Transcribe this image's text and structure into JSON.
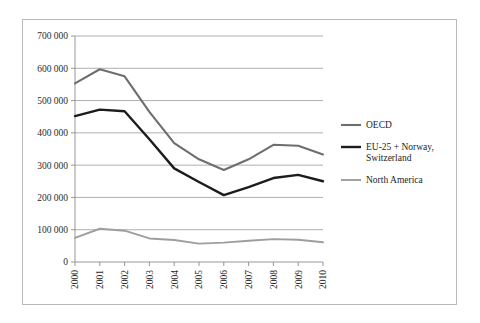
{
  "chart_data": {
    "type": "line",
    "title": "",
    "subtitle": "",
    "xlabel": "",
    "ylabel": "",
    "x": [
      "2000",
      "2001",
      "2002",
      "2003",
      "2004",
      "2005",
      "2006",
      "2007",
      "2008",
      "2009",
      "2010"
    ],
    "categories": [
      "2000",
      "2001",
      "2002",
      "2003",
      "2004",
      "2005",
      "2006",
      "2007",
      "2008",
      "2009",
      "2010"
    ],
    "ylim": [
      0,
      700000
    ],
    "ytick_values": [
      0,
      100000,
      200000,
      300000,
      400000,
      500000,
      600000,
      700000
    ],
    "ytick_labels": [
      "0",
      "100 000",
      "200 000",
      "300 000",
      "400 000",
      "500 000",
      "600 000",
      "700 000"
    ],
    "grid": true,
    "grid_axis": "y",
    "legend_position": "right",
    "xtick_rotation": 90,
    "series": [
      {
        "name": "OECD",
        "color": "#6e6e6e",
        "width": 2.1,
        "values": [
          553000,
          597000,
          575000,
          465000,
          368000,
          318000,
          285000,
          318000,
          363000,
          360000,
          333000
        ]
      },
      {
        "name": "EU-25 + Norway, Switzerland",
        "color": "#1c1c1c",
        "width": 2.4,
        "values": [
          452000,
          472000,
          467000,
          380000,
          290000,
          248000,
          207000,
          232000,
          260000,
          270000,
          250000
        ]
      },
      {
        "name": "North America",
        "color": "#9e9e9e",
        "width": 1.9,
        "values": [
          75000,
          103000,
          97000,
          73000,
          68000,
          57000,
          60000,
          66000,
          71000,
          69000,
          61000
        ]
      }
    ]
  },
  "legend": {
    "entries": [
      {
        "label": "OECD",
        "label2": "",
        "color": "#6e6e6e"
      },
      {
        "label": "EU-25 + Norway,",
        "label2": "Switzerland",
        "color": "#1c1c1c"
      },
      {
        "label": "North America",
        "label2": "",
        "color": "#9e9e9e"
      }
    ]
  },
  "axis": {
    "y_labels": [
      "700 000",
      "600 000",
      "500 000",
      "400 000",
      "300 000",
      "200 000",
      "100 000",
      "0"
    ],
    "x_labels": [
      "2000",
      "2001",
      "2002",
      "2003",
      "2004",
      "2005",
      "2006",
      "2007",
      "2008",
      "2009",
      "2010"
    ]
  }
}
